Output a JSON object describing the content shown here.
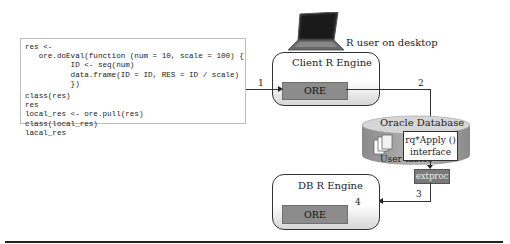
{
  "code_panel": {
    "lines": [
      "res <-",
      "   ore.doEval(function (num = 10, scale = 100) {",
      "          ID <- seq(num)",
      "          data.frame(ID = ID, RES = ID / scale)",
      "          })",
      "class(res)",
      "res",
      "local_res <- ore.pull(res)",
      "class(local_res)",
      "lacal_res"
    ]
  },
  "diagram": {
    "laptop_label": "R user on desktop",
    "client_engine": {
      "title": "Client R Engine",
      "ore_label": "ORE"
    },
    "database": {
      "title": "Oracle Database",
      "tables_label": "User tables",
      "interface_label_1": "rq*Apply ()",
      "interface_label_2": "interface",
      "extproc_label": "extproc"
    },
    "db_engine": {
      "title": "DB R Engine",
      "ore_label": "ORE"
    },
    "steps": [
      "1",
      "2",
      "3",
      "4"
    ]
  },
  "colors": {
    "ore_fill": "#8c8c8c",
    "db_fill": "#a8a8a8",
    "extproc_fill": "#7a7a7a"
  }
}
